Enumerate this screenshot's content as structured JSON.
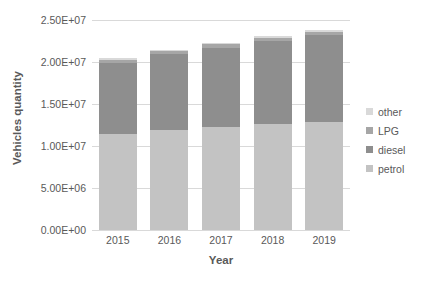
{
  "chart_data": {
    "type": "bar",
    "subtype": "stacked-bar",
    "title": "",
    "xlabel": "Year",
    "ylabel": "Vehicles quantity",
    "categories": [
      "2015",
      "2016",
      "2017",
      "2018",
      "2019"
    ],
    "series": [
      {
        "name": "petrol",
        "color": "#c3c3c3",
        "values": [
          11400000,
          11900000,
          12300000,
          12600000,
          12900000
        ]
      },
      {
        "name": "diesel",
        "color": "#8e8e8e",
        "values": [
          8500000,
          9000000,
          9400000,
          9900000,
          10300000
        ]
      },
      {
        "name": "LPG",
        "color": "#a6a6a6",
        "values": [
          400000,
          400000,
          400000,
          400000,
          400000
        ]
      },
      {
        "name": "other",
        "color": "#d9d9d9",
        "values": [
          150000,
          160000,
          170000,
          180000,
          190000
        ]
      }
    ],
    "totals": [
      20450000,
      21460000,
      22270000,
      23080000,
      23790000
    ],
    "ylim": [
      0,
      25000000
    ],
    "ytick_values": [
      0,
      5000000,
      10000000,
      15000000,
      20000000,
      25000000
    ],
    "ytick_labels": [
      "0.00E+00",
      "5.00E+06",
      "1.00E+07",
      "1.50E+07",
      "2.00E+07",
      "2.50E+07"
    ],
    "grid": true,
    "legend_position": "right",
    "legend_entries": [
      "other",
      "LPG",
      "diesel",
      "petrol"
    ]
  },
  "axis": {
    "y_title": "Vehicles quantity",
    "x_title": "Year"
  },
  "legend": {
    "items": [
      {
        "label": "other",
        "color": "#d9d9d9"
      },
      {
        "label": "LPG",
        "color": "#a6a6a6"
      },
      {
        "label": "diesel",
        "color": "#8e8e8e"
      },
      {
        "label": "petrol",
        "color": "#c3c3c3"
      }
    ]
  },
  "colors": {
    "grid": "#d9d9d9",
    "text": "#595959",
    "background": "#ffffff"
  }
}
